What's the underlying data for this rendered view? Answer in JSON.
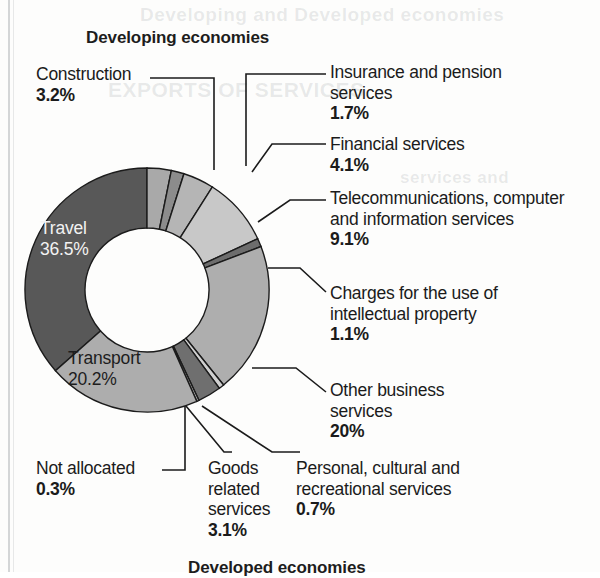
{
  "page": {
    "title": "Developing economies",
    "bottom_title": "Developed economies",
    "bleed_text_top": "Developing and Developed economies",
    "bleed_text_mid": "EXPORTS OF SERVICES",
    "bleed_text_low": "services and"
  },
  "chart_data": {
    "type": "pie",
    "variant": "donut",
    "title": "Developing economies",
    "unit": "percent",
    "total": 100,
    "categories": [
      "Travel",
      "Construction",
      "Insurance and pension services",
      "Financial services",
      "Telecommunications, computer and information services",
      "Charges for the use of intellectual property",
      "Other business services",
      "Personal, cultural and recreational services",
      "Goods related services",
      "Not allocated",
      "Transport"
    ],
    "values": [
      36.5,
      3.2,
      1.7,
      4.1,
      9.1,
      1.1,
      20,
      0.7,
      3.1,
      0.3,
      20.2
    ],
    "colors": [
      "#585858",
      "#a9a9a9",
      "#8c8c8c",
      "#b5b5b5",
      "#c8c8c8",
      "#6d6d6d",
      "#aeaeae",
      "#d0d0d0",
      "#6f6f6f",
      "#bcbcbc",
      "#adadad"
    ],
    "legend": "none",
    "grid": false
  },
  "slice_labels": {
    "travel": {
      "name": "Travel",
      "pct": "36.5%"
    },
    "transport": {
      "name": "Transport",
      "pct": "20.2%"
    }
  },
  "callouts": {
    "construction": {
      "name": "Construction",
      "pct": "3.2%"
    },
    "insurance": {
      "name": "Insurance and pension services",
      "pct": "1.7%"
    },
    "financial": {
      "name": "Financial services",
      "pct": "4.1%"
    },
    "telecom": {
      "name": "Telecommunications, computer and information services",
      "pct": "9.1%"
    },
    "charges": {
      "name": "Charges for the use of intellectual property",
      "pct": "1.1%"
    },
    "other_business": {
      "name": "Other business services",
      "pct": "20%"
    },
    "not_allocated": {
      "name": "Not allocated",
      "pct": "0.3%"
    },
    "goods": {
      "name": "Goods related services",
      "pct": "3.1%"
    },
    "personal": {
      "name": "Personal, cultural and recreational services",
      "pct": "0.7%"
    }
  }
}
